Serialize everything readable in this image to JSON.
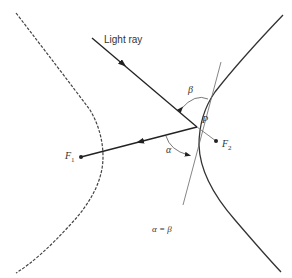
{
  "diagram": {
    "type": "hyperbola-reflection",
    "labels": {
      "light_ray": "Light ray",
      "point_p": "P",
      "focus_1": "F",
      "focus_1_sub": "1",
      "focus_2": "F",
      "focus_2_sub": "2",
      "angle_alpha": "α",
      "angle_beta": "β",
      "equation": "α = β"
    },
    "colors": {
      "stroke": "#333333",
      "thin_line": "#555555",
      "background": "#ffffff"
    }
  }
}
